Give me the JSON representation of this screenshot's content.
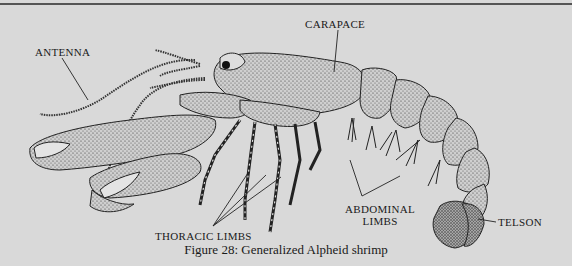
{
  "figure": {
    "caption": "Figure 28: Generalized Alpheid shrimp",
    "colors": {
      "background": "#d9d9d9",
      "ink": "#1a1a1a",
      "stipple": "#2a2a2a"
    }
  },
  "labels": {
    "antenna": "ANTENNA",
    "carapace": "CARAPACE",
    "thoracic_limbs": "THORACIC LIMBS",
    "abdominal_line1": "ABDOMINAL",
    "abdominal_line2": "LIMBS",
    "telson": "TELSON"
  }
}
